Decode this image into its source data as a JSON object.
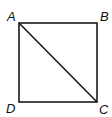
{
  "diagram": {
    "type": "geometry",
    "shape": "square",
    "vertices": [
      {
        "label": "A",
        "x": 19,
        "y": 23
      },
      {
        "label": "B",
        "x": 97,
        "y": 23
      },
      {
        "label": "C",
        "x": 97,
        "y": 102
      },
      {
        "label": "D",
        "x": 19,
        "y": 102
      }
    ],
    "diagonal": {
      "from": "A",
      "to": "C"
    },
    "stroke_color": "#1a1a1a",
    "labels": {
      "a": "A",
      "b": "B",
      "c": "C",
      "d": "D"
    }
  }
}
